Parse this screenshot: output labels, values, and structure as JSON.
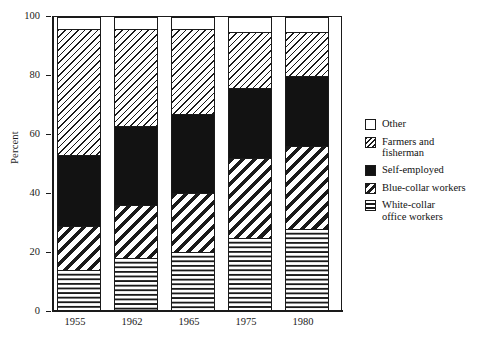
{
  "chart_data": {
    "type": "bar",
    "subtype": "stacked-100-percent",
    "title": "",
    "xlabel": "",
    "ylabel": "Percent",
    "ylim": [
      0,
      100
    ],
    "yticks": [
      0,
      20,
      40,
      60,
      80,
      100
    ],
    "ytick_labels": [
      "0",
      "20",
      "40",
      "60",
      "80",
      "100"
    ],
    "grid": false,
    "legend_position": "right",
    "categories": [
      "1955",
      "1962",
      "1965",
      "1975",
      "1980"
    ],
    "series": [
      {
        "name": "White-collar office workers",
        "pattern": "dotted",
        "color": "#1a1a1a",
        "values": [
          14,
          18,
          20,
          25,
          28
        ]
      },
      {
        "name": "Blue-collar workers",
        "pattern": "thick-diagonal-hatch",
        "color": "#1a1a1a",
        "values": [
          15,
          18,
          20,
          27,
          28
        ]
      },
      {
        "name": "Self-employed",
        "pattern": "solid",
        "color": "#121212",
        "values": [
          24,
          27,
          27,
          24,
          24
        ]
      },
      {
        "name": "Farmers and fisherman",
        "pattern": "fine-diagonal-hatch",
        "color": "#1a1a1a",
        "values": [
          43,
          33,
          29,
          19,
          15
        ]
      },
      {
        "name": "Other",
        "pattern": "empty",
        "color": "#ffffff",
        "values": [
          4,
          4,
          4,
          5,
          5
        ]
      }
    ]
  },
  "axis": {
    "y_title": "Percent",
    "y_ticks": [
      "100",
      "80",
      "60",
      "40",
      "20",
      "0"
    ],
    "x_ticks": [
      "1955",
      "1962",
      "1965",
      "1975",
      "1980"
    ]
  },
  "legend": {
    "items": [
      {
        "label": "Other",
        "label2": "",
        "swatch": "empty-swatch"
      },
      {
        "label": "Farmers and",
        "label2": "fisherman",
        "swatch": "fine-hatch-swatch"
      },
      {
        "label": "Self-employed",
        "label2": "",
        "swatch": "solid-black-swatch"
      },
      {
        "label": "Blue-collar workers",
        "label2": "",
        "swatch": "thick-hatch-swatch"
      },
      {
        "label": "White-collar",
        "label2": "office workers",
        "swatch": "dotted-swatch"
      }
    ]
  }
}
